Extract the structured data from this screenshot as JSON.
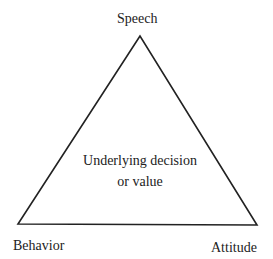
{
  "diagram": {
    "type": "triangle",
    "vertices": {
      "top": {
        "label": "Speech",
        "x": 140,
        "y": 36
      },
      "bottom_left": {
        "label": "Behavior",
        "x": 18,
        "y": 224
      },
      "bottom_right": {
        "label": "Attitude",
        "x": 257,
        "y": 225
      }
    },
    "center": {
      "line1": "Underlying decision",
      "line2": "or value"
    },
    "colors": {
      "line": "#222222",
      "text": "#222222",
      "background": "#ffffff"
    }
  }
}
